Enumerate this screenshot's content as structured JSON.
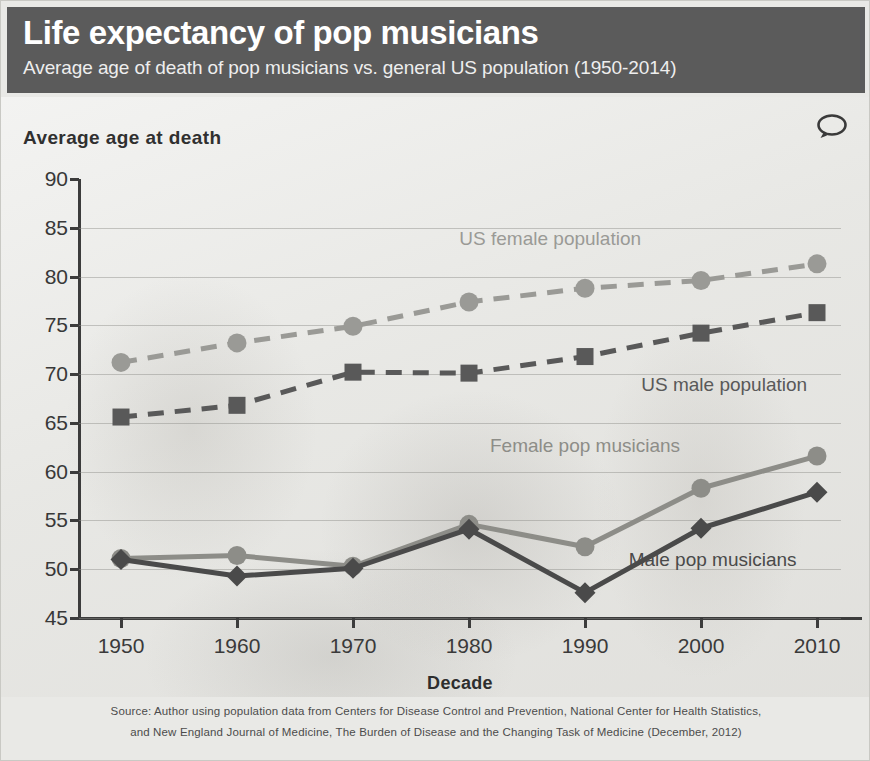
{
  "header": {
    "title": "Life expectancy of pop musicians",
    "subtitle": "Average age of death of pop musicians vs. general US population (1950-2014)",
    "bg_color": "#5b5b5b",
    "title_color": "#ffffff"
  },
  "icons": {
    "comment": "speech-bubble-icon"
  },
  "footer": {
    "line1": "Source: Author using population data from Centers for Disease Control and Prevention, National Center for Health Statistics,",
    "line2": "and New England Journal of Medicine, The Burden of Disease and the Changing Task of Medicine (December, 2012)"
  },
  "chart_data": {
    "type": "line",
    "title": "Life expectancy of pop musicians",
    "subtitle": "Average age of death of pop musicians vs. general US population (1950-2014)",
    "xlabel": "Decade",
    "ylabel": "Average age at death",
    "x": [
      1950,
      1960,
      1970,
      1980,
      1990,
      2000,
      2010
    ],
    "categories": [
      "1950",
      "1960",
      "1970",
      "1980",
      "1990",
      "2000",
      "2010"
    ],
    "xtick_labels": [
      "1950",
      "1960",
      "1970",
      "1980",
      "1990",
      "2000",
      "2010"
    ],
    "ytick_labels": [
      "45",
      "50",
      "55",
      "60",
      "65",
      "70",
      "75",
      "80",
      "85",
      "90"
    ],
    "ylim": [
      45,
      90
    ],
    "ytick_step": 5,
    "grid": true,
    "legend": "inline-labels",
    "series": [
      {
        "name": "US female population",
        "values": [
          71.2,
          73.2,
          74.9,
          77.4,
          78.8,
          79.6,
          81.3
        ],
        "color": "#9a9a96",
        "marker": "circle",
        "dash": true,
        "label_x": 1987,
        "label_y": 83.8
      },
      {
        "name": "US male population",
        "values": [
          65.6,
          66.8,
          70.2,
          70.1,
          71.8,
          74.2,
          76.3
        ],
        "color": "#595959",
        "marker": "square",
        "dash": true,
        "label_x": 2002,
        "label_y": 68.9
      },
      {
        "name": "Female pop musicians",
        "values": [
          51.1,
          51.4,
          50.3,
          54.6,
          52.3,
          58.3,
          61.6
        ],
        "color": "#8d8d88",
        "marker": "circle",
        "dash": false,
        "label_x": 1990,
        "label_y": 62.6
      },
      {
        "name": "Male pop musicians",
        "values": [
          51.0,
          49.3,
          50.1,
          54.1,
          47.6,
          54.2,
          57.9
        ],
        "color": "#4a4a4a",
        "marker": "diamond",
        "dash": false,
        "label_x": 2001,
        "label_y": 50.9
      }
    ]
  }
}
